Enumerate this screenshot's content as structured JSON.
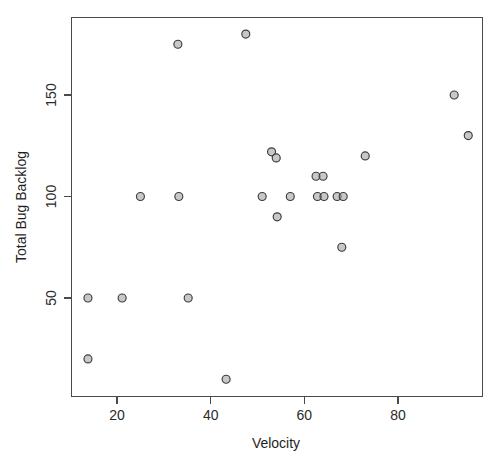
{
  "chart_data": {
    "type": "scatter",
    "title": "",
    "xlabel": "Velocity",
    "ylabel": "Total Bug Backlog",
    "xlim": [
      12,
      98
    ],
    "ylim": [
      5,
      186
    ],
    "grid": false,
    "legend": null,
    "x_ticks": [
      20,
      40,
      60,
      80
    ],
    "y_ticks": [
      50,
      100,
      150
    ],
    "x_tick_labels": [
      "20",
      "40",
      "60",
      "80"
    ],
    "y_tick_labels": [
      "50",
      "100",
      "150"
    ],
    "point_style": {
      "marker": "open-circle",
      "radius": 4,
      "fill": "#9a9a9a",
      "stroke": "#3c3c3c"
    },
    "n_points": 24,
    "x": [
      13.8,
      13.8,
      21.1,
      25.0,
      33.0,
      33.2,
      35.2,
      43.3,
      47.5,
      51.0,
      53.0,
      54.0,
      54.2,
      57.0,
      62.5,
      62.8,
      64.0,
      64.2,
      67.0,
      68.0,
      68.3,
      73.0,
      92.0,
      95.0
    ],
    "y": [
      50,
      20,
      50,
      100,
      175,
      100,
      50,
      10,
      180,
      100,
      122,
      119,
      90,
      100,
      110,
      100,
      110,
      100,
      100,
      75,
      100,
      120,
      150,
      130
    ],
    "points": [
      {
        "x": 13.8,
        "y": 50
      },
      {
        "x": 13.8,
        "y": 20
      },
      {
        "x": 21.1,
        "y": 50
      },
      {
        "x": 25.0,
        "y": 100
      },
      {
        "x": 33.0,
        "y": 175
      },
      {
        "x": 33.2,
        "y": 100
      },
      {
        "x": 35.2,
        "y": 50
      },
      {
        "x": 43.3,
        "y": 10
      },
      {
        "x": 47.5,
        "y": 180
      },
      {
        "x": 51.0,
        "y": 100
      },
      {
        "x": 53.0,
        "y": 122
      },
      {
        "x": 54.0,
        "y": 119
      },
      {
        "x": 54.2,
        "y": 90
      },
      {
        "x": 57.0,
        "y": 100
      },
      {
        "x": 62.5,
        "y": 110
      },
      {
        "x": 62.8,
        "y": 100
      },
      {
        "x": 64.0,
        "y": 110
      },
      {
        "x": 64.2,
        "y": 100
      },
      {
        "x": 67.0,
        "y": 100
      },
      {
        "x": 68.0,
        "y": 75
      },
      {
        "x": 68.3,
        "y": 100
      },
      {
        "x": 73.0,
        "y": 120
      },
      {
        "x": 92.0,
        "y": 150
      },
      {
        "x": 95.0,
        "y": 130
      }
    ],
    "colors": {
      "axis": "#4a4a4a",
      "text": "#1f1f1f",
      "point_fill": "#9a9a9a",
      "point_stroke": "#3c3c3c",
      "background": "#ffffff"
    }
  }
}
